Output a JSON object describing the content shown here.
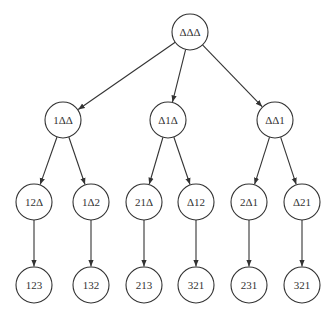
{
  "diagram": {
    "type": "tree",
    "node_radius": 18,
    "nodes": [
      {
        "id": "root",
        "label": "ΔΔΔ",
        "x": 190,
        "y": 32
      },
      {
        "id": "n1",
        "label": "1ΔΔ",
        "x": 63,
        "y": 120
      },
      {
        "id": "n2",
        "label": "Δ1Δ",
        "x": 168,
        "y": 120
      },
      {
        "id": "n3",
        "label": "ΔΔ1",
        "x": 275,
        "y": 120
      },
      {
        "id": "n11",
        "label": "12Δ",
        "x": 34,
        "y": 202
      },
      {
        "id": "n12",
        "label": "1Δ2",
        "x": 91,
        "y": 202
      },
      {
        "id": "n21",
        "label": "21Δ",
        "x": 144,
        "y": 202
      },
      {
        "id": "n22",
        "label": "Δ12",
        "x": 196,
        "y": 202
      },
      {
        "id": "n31",
        "label": "2Δ1",
        "x": 249,
        "y": 202
      },
      {
        "id": "n32",
        "label": "Δ21",
        "x": 302,
        "y": 202
      },
      {
        "id": "l1",
        "label": "123",
        "x": 34,
        "y": 285
      },
      {
        "id": "l2",
        "label": "132",
        "x": 91,
        "y": 285
      },
      {
        "id": "l3",
        "label": "213",
        "x": 144,
        "y": 285
      },
      {
        "id": "l4",
        "label": "321",
        "x": 196,
        "y": 285
      },
      {
        "id": "l5",
        "label": "231",
        "x": 249,
        "y": 285
      },
      {
        "id": "l6",
        "label": "321",
        "x": 302,
        "y": 285
      }
    ],
    "edges": [
      [
        "root",
        "n1"
      ],
      [
        "root",
        "n2"
      ],
      [
        "root",
        "n3"
      ],
      [
        "n1",
        "n11"
      ],
      [
        "n1",
        "n12"
      ],
      [
        "n2",
        "n21"
      ],
      [
        "n2",
        "n22"
      ],
      [
        "n3",
        "n31"
      ],
      [
        "n3",
        "n32"
      ],
      [
        "n11",
        "l1"
      ],
      [
        "n12",
        "l2"
      ],
      [
        "n21",
        "l3"
      ],
      [
        "n22",
        "l4"
      ],
      [
        "n31",
        "l5"
      ],
      [
        "n32",
        "l6"
      ]
    ]
  }
}
